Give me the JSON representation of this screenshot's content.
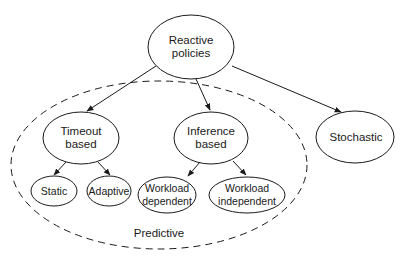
{
  "diagram": {
    "type": "hierarchy-tree",
    "colors": {
      "stroke": "#1a1a1a",
      "background": "#ffffff",
      "text": "#1a1a1a"
    },
    "nodes": {
      "reactive": {
        "line1": "Reactive",
        "line2": "policies"
      },
      "timeout": {
        "line1": "Timeout",
        "line2": "based"
      },
      "inference": {
        "line1": "Inference",
        "line2": "based"
      },
      "stochastic": {
        "line1": "Stochastic"
      },
      "static": {
        "line1": "Static"
      },
      "adaptive": {
        "line1": "Adaptive"
      },
      "workload_dependent": {
        "line1": "Workload",
        "line2": "dependent"
      },
      "workload_independent": {
        "line1": "Workload",
        "line2": "independent"
      }
    },
    "group": {
      "label": "Predictive",
      "members": [
        "Timeout based",
        "Inference based",
        "Static",
        "Adaptive",
        "Workload dependent",
        "Workload independent"
      ]
    },
    "edges": [
      {
        "from": "Reactive policies",
        "to": "Timeout based"
      },
      {
        "from": "Reactive policies",
        "to": "Inference based"
      },
      {
        "from": "Reactive policies",
        "to": "Stochastic"
      },
      {
        "from": "Timeout based",
        "to": "Static"
      },
      {
        "from": "Timeout based",
        "to": "Adaptive"
      },
      {
        "from": "Inference based",
        "to": "Workload dependent"
      },
      {
        "from": "Inference based",
        "to": "Workload independent"
      }
    ]
  }
}
